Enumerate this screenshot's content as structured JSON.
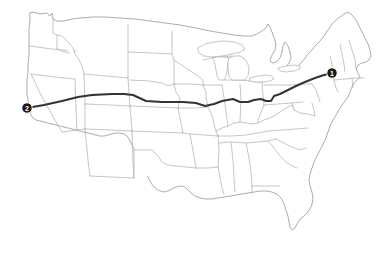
{
  "map": {
    "title": "United States route map",
    "background_color": "#ffffff",
    "state_border_color": "#a0a0a0",
    "coastline_color": "#8a8a8a",
    "width": 387,
    "height": 258
  },
  "route": {
    "name": "cross-country-route",
    "line_color": "#333333",
    "line_width": 2,
    "points": "27,108 44,105 62,101 78,97 92,95 112,94 124,94 133,95 146,101 162,102 183,102 196,103 205,106 214,104 222,101 233,99 240,102 248,102 254,100 261,99 266,101 271,101 274,96 280,94 288,90 296,86 305,82 315,78 324,75 332,73"
  },
  "markers": [
    {
      "id": "marker-1",
      "label": "1",
      "x": 332,
      "y": 73,
      "radius": 5.2,
      "fill": "#1a1a1a",
      "text_color": "#ffffff",
      "region": "northeast-endpoint"
    },
    {
      "id": "marker-2",
      "label": "2",
      "x": 27,
      "y": 108,
      "radius": 5.2,
      "fill": "#1a1a1a",
      "text_color": "#ffffff",
      "region": "west-coast-endpoint"
    }
  ],
  "legend": {
    "visible": false
  }
}
